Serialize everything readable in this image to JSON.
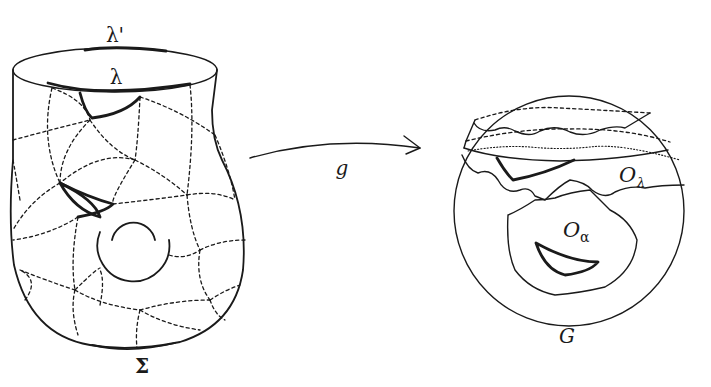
{
  "figure": {
    "left_surface": {
      "name": "Σ",
      "label_lambda": "λ",
      "label_lambda_prime": "λ'"
    },
    "map": {
      "label": "g"
    },
    "right_group": {
      "name": "G",
      "label_O_lambda_main": "O",
      "label_O_lambda_sub": "λ",
      "label_O_alpha_main": "O",
      "label_O_alpha_sub": "α"
    }
  },
  "colors": {
    "ink": "#1a1a1a",
    "background": "#ffffff"
  }
}
